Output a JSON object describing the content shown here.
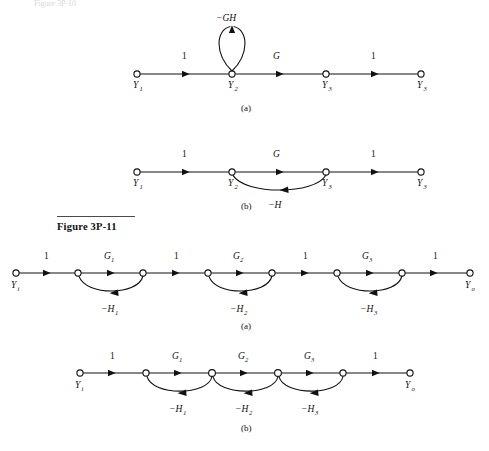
{
  "page": {
    "background": "#ffffff",
    "ink": "#111111",
    "top_partial_text": "Figure 3P-10"
  },
  "figure_caption": {
    "label": "Figure 3P-11"
  },
  "figures": [
    {
      "id": "fig-3p-10",
      "panels": [
        {
          "panel_label": "(a)",
          "nodes": [
            {
              "name": "Y",
              "sub": "1"
            },
            {
              "name": "Y",
              "sub": "2"
            },
            {
              "name": "Y",
              "sub": "3"
            },
            {
              "name": "Y",
              "sub": "3"
            }
          ],
          "forward_branches": [
            {
              "gain": "1",
              "sub": ""
            },
            {
              "gain": "G",
              "sub": ""
            },
            {
              "gain": "1",
              "sub": ""
            }
          ],
          "self_loops": [
            {
              "gain": "−GH",
              "at_node": "Y2"
            }
          ],
          "feedback_branches": []
        },
        {
          "panel_label": "(b)",
          "nodes": [
            {
              "name": "Y",
              "sub": "1"
            },
            {
              "name": "Y",
              "sub": "2"
            },
            {
              "name": "Y",
              "sub": "3"
            },
            {
              "name": "Y",
              "sub": "3"
            }
          ],
          "forward_branches": [
            {
              "gain": "1",
              "sub": ""
            },
            {
              "gain": "G",
              "sub": ""
            },
            {
              "gain": "1",
              "sub": ""
            }
          ],
          "self_loops": [],
          "feedback_branches": [
            {
              "gain": "−H",
              "sub": "",
              "from": "Y3",
              "to": "Y2"
            }
          ]
        }
      ]
    },
    {
      "id": "fig-3p-11",
      "panels": [
        {
          "panel_label": "(a)",
          "input_node": {
            "name": "Y",
            "sub": "i"
          },
          "output_node": {
            "name": "Y",
            "sub": "o"
          },
          "forward_branches": [
            {
              "gain": "1",
              "sub": ""
            },
            {
              "gain": "G",
              "sub": "1"
            },
            {
              "gain": "1",
              "sub": ""
            },
            {
              "gain": "G",
              "sub": "2"
            },
            {
              "gain": "1",
              "sub": ""
            },
            {
              "gain": "G",
              "sub": "3"
            },
            {
              "gain": "1",
              "sub": ""
            }
          ],
          "feedback_branches": [
            {
              "gain": "−H",
              "sub": "1"
            },
            {
              "gain": "−H",
              "sub": "2"
            },
            {
              "gain": "−H",
              "sub": "3"
            }
          ]
        },
        {
          "panel_label": "(b)",
          "input_node": {
            "name": "Y",
            "sub": "i"
          },
          "output_node": {
            "name": "Y",
            "sub": "o"
          },
          "forward_branches": [
            {
              "gain": "1",
              "sub": ""
            },
            {
              "gain": "G",
              "sub": "1"
            },
            {
              "gain": "G",
              "sub": "2"
            },
            {
              "gain": "G",
              "sub": "3"
            },
            {
              "gain": "1",
              "sub": ""
            }
          ],
          "feedback_branches": [
            {
              "gain": "−H",
              "sub": "1"
            },
            {
              "gain": "−H",
              "sub": "2"
            },
            {
              "gain": "−H",
              "sub": "3"
            }
          ]
        }
      ]
    }
  ]
}
